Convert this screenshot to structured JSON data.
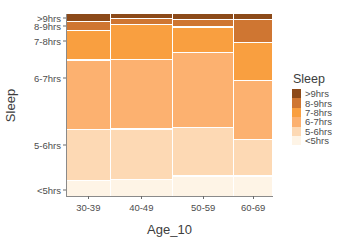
{
  "chart_data": {
    "type": "bar",
    "subtype": "mosaic-spineplot",
    "title": "",
    "xlabel": "Age_10",
    "ylabel": "Sleep",
    "grid": false,
    "legend_position": "right",
    "legend_title": "Sleep",
    "categories": [
      "30-39",
      "40-49",
      "50-59",
      "60-69"
    ],
    "series_order": [
      ">9hrs",
      "8-9hrs",
      "7-8hrs",
      "6-7hrs",
      "5-6hrs",
      "<5hrs"
    ],
    "colors": {
      ">9hrs": "#8c4a19",
      "8-9hrs": "#cf7632",
      "7-8hrs": "#f99f४0",
      "6-7hrs": "#fcb170",
      "5-6hrs": "#fdd9b4",
      "<5hrs": "#fef4e6"
    },
    "column_widths_pct": [
      20.3,
      29.3,
      28.8,
      17.9
    ],
    "series": [
      {
        "name": ">9hrs",
        "color": "#8c4a19",
        "values": [
          4.0,
          2.2,
          2.8,
          3.0
        ]
      },
      {
        "name": "8-9hrs",
        "color": "#cf7632",
        "values": [
          4.4,
          2.8,
          3.6,
          12.0
        ]
      },
      {
        "name": "7-8hrs",
        "color": "#f99f40",
        "values": [
          16.0,
          19.0,
          13.6,
          21.0
        ]
      },
      {
        "name": "6-7hrs",
        "color": "#fcb170",
        "values": [
          39.0,
          39.0,
          42.0,
          33.0
        ]
      },
      {
        "name": "5-6hrs",
        "color": "#fdd9b4",
        "values": [
          28.0,
          28.0,
          27.0,
          20.0
        ]
      },
      {
        "name": "<5hrs",
        "color": "#fef4e6",
        "values": [
          8.6,
          9.0,
          11.0,
          11.0
        ]
      }
    ],
    "ytick_labels": [
      ">9hrs",
      "8-9hrs",
      "7-8hrs",
      "6-7hrs",
      "5-6hrs",
      "<5hrs"
    ],
    "ytick_positions_pct": [
      2.2,
      6.6,
      14.8,
      35.2,
      72.0,
      96.7
    ]
  },
  "axis": {
    "x_title": "Age_10",
    "y_title": "Sleep",
    "x_labels": [
      "30-39",
      "40-49",
      "50-59",
      "60-69"
    ],
    "y_labels": [
      ">9hrs",
      "8-9hrs",
      "7-8hrs",
      "6-7hrs",
      "5-6hrs",
      "<5hrs"
    ]
  },
  "legend": {
    "title": "Sleep",
    "items": [
      {
        "label": ">9hrs",
        "color": "#8c4a19"
      },
      {
        "label": "8-9hrs",
        "color": "#cf7632"
      },
      {
        "label": "7-8hrs",
        "color": "#f99f40"
      },
      {
        "label": "6-7hrs",
        "color": "#fcb170"
      },
      {
        "label": "5-6hrs",
        "color": "#fdd9b4"
      },
      {
        "label": "<5hrs",
        "color": "#fef4e6"
      }
    ]
  }
}
